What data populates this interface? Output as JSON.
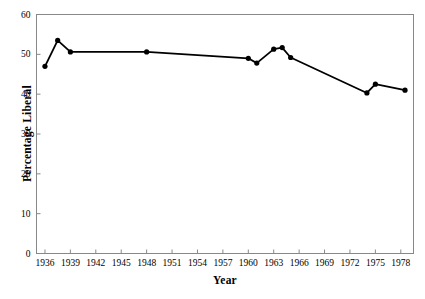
{
  "chart_data": {
    "type": "line",
    "title": "",
    "xlabel": "Year",
    "ylabel": "Percentage Liberal",
    "xlim": [
      1935,
      1979.5
    ],
    "ylim": [
      0,
      60
    ],
    "xticks": [
      "1936",
      "1939",
      "1942",
      "1945",
      "1948",
      "1951",
      "1954",
      "1957",
      "1960",
      "1963",
      "1966",
      "1969",
      "1972",
      "1975",
      "1978"
    ],
    "xtick_values": [
      1936,
      1939,
      1942,
      1945,
      1948,
      1951,
      1954,
      1957,
      1960,
      1963,
      1966,
      1969,
      1972,
      1975,
      1978
    ],
    "yticks": [
      "0",
      "10",
      "20",
      "30",
      "40",
      "50",
      "60"
    ],
    "ytick_values": [
      0,
      10,
      20,
      30,
      40,
      50,
      60
    ],
    "grid": false,
    "legend": false,
    "marker": "filled-circle",
    "line_color": "#000000",
    "marker_color": "#000000",
    "axis_color": "#888888",
    "x": [
      1936,
      1937.5,
      1939,
      1948,
      1960,
      1961,
      1963,
      1964,
      1965,
      1974,
      1975,
      1978.5
    ],
    "values": [
      47.0,
      53.5,
      50.6,
      50.6,
      49.0,
      47.8,
      51.3,
      51.7,
      49.2,
      40.3,
      42.5,
      41.0
    ],
    "series": [
      {
        "name": "Percentage Liberal",
        "points": [
          {
            "x": 1936,
            "y": 47.0
          },
          {
            "x": 1937.5,
            "y": 53.5
          },
          {
            "x": 1939,
            "y": 50.6
          },
          {
            "x": 1948,
            "y": 50.6
          },
          {
            "x": 1960,
            "y": 49.0
          },
          {
            "x": 1961,
            "y": 47.8
          },
          {
            "x": 1963,
            "y": 51.3
          },
          {
            "x": 1964,
            "y": 51.7
          },
          {
            "x": 1965,
            "y": 49.2
          },
          {
            "x": 1974,
            "y": 40.3
          },
          {
            "x": 1975,
            "y": 42.5
          },
          {
            "x": 1978.5,
            "y": 41.0
          }
        ]
      }
    ]
  }
}
